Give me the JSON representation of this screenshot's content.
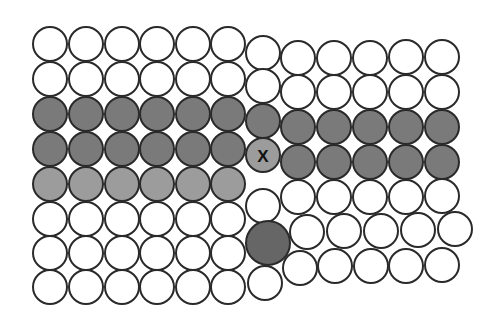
{
  "diagram": {
    "type": "crystal-lattice-defects",
    "colors": {
      "white": "#ffffff",
      "dark": "#7a7a7a",
      "light": "#9c9c9c",
      "impurity": "#666666",
      "stroke": "#2a2a2a"
    },
    "stroke_width": 2,
    "atoms": [
      {
        "x": 50,
        "y": 44,
        "r": 17,
        "fill": "white"
      },
      {
        "x": 86,
        "y": 44,
        "r": 17,
        "fill": "white"
      },
      {
        "x": 122,
        "y": 44,
        "r": 17,
        "fill": "white"
      },
      {
        "x": 157,
        "y": 44,
        "r": 17,
        "fill": "white"
      },
      {
        "x": 193,
        "y": 44,
        "r": 17,
        "fill": "white"
      },
      {
        "x": 228,
        "y": 44,
        "r": 17,
        "fill": "white"
      },
      {
        "x": 50,
        "y": 79,
        "r": 17,
        "fill": "white"
      },
      {
        "x": 86,
        "y": 79,
        "r": 17,
        "fill": "white"
      },
      {
        "x": 122,
        "y": 79,
        "r": 17,
        "fill": "white"
      },
      {
        "x": 157,
        "y": 79,
        "r": 17,
        "fill": "white"
      },
      {
        "x": 193,
        "y": 79,
        "r": 17,
        "fill": "white"
      },
      {
        "x": 228,
        "y": 79,
        "r": 17,
        "fill": "white"
      },
      {
        "x": 50,
        "y": 114,
        "r": 17,
        "fill": "dark"
      },
      {
        "x": 86,
        "y": 114,
        "r": 17,
        "fill": "dark"
      },
      {
        "x": 122,
        "y": 114,
        "r": 17,
        "fill": "dark"
      },
      {
        "x": 157,
        "y": 114,
        "r": 17,
        "fill": "dark"
      },
      {
        "x": 193,
        "y": 114,
        "r": 17,
        "fill": "dark"
      },
      {
        "x": 228,
        "y": 114,
        "r": 17,
        "fill": "dark"
      },
      {
        "x": 50,
        "y": 149,
        "r": 17,
        "fill": "dark"
      },
      {
        "x": 86,
        "y": 149,
        "r": 17,
        "fill": "dark"
      },
      {
        "x": 122,
        "y": 149,
        "r": 17,
        "fill": "dark"
      },
      {
        "x": 157,
        "y": 149,
        "r": 17,
        "fill": "dark"
      },
      {
        "x": 193,
        "y": 149,
        "r": 17,
        "fill": "dark"
      },
      {
        "x": 228,
        "y": 149,
        "r": 17,
        "fill": "dark"
      },
      {
        "x": 50,
        "y": 184,
        "r": 17,
        "fill": "light"
      },
      {
        "x": 86,
        "y": 184,
        "r": 17,
        "fill": "light"
      },
      {
        "x": 122,
        "y": 184,
        "r": 17,
        "fill": "light"
      },
      {
        "x": 157,
        "y": 184,
        "r": 17,
        "fill": "light"
      },
      {
        "x": 193,
        "y": 184,
        "r": 17,
        "fill": "light"
      },
      {
        "x": 228,
        "y": 184,
        "r": 17,
        "fill": "light"
      },
      {
        "x": 50,
        "y": 219,
        "r": 17,
        "fill": "white"
      },
      {
        "x": 86,
        "y": 219,
        "r": 17,
        "fill": "white"
      },
      {
        "x": 122,
        "y": 219,
        "r": 17,
        "fill": "white"
      },
      {
        "x": 157,
        "y": 219,
        "r": 17,
        "fill": "white"
      },
      {
        "x": 193,
        "y": 219,
        "r": 17,
        "fill": "white"
      },
      {
        "x": 228,
        "y": 219,
        "r": 17,
        "fill": "white"
      },
      {
        "x": 50,
        "y": 253,
        "r": 17,
        "fill": "white"
      },
      {
        "x": 86,
        "y": 253,
        "r": 17,
        "fill": "white"
      },
      {
        "x": 122,
        "y": 253,
        "r": 17,
        "fill": "white"
      },
      {
        "x": 157,
        "y": 253,
        "r": 17,
        "fill": "white"
      },
      {
        "x": 193,
        "y": 253,
        "r": 17,
        "fill": "white"
      },
      {
        "x": 228,
        "y": 253,
        "r": 17,
        "fill": "white"
      },
      {
        "x": 50,
        "y": 287,
        "r": 17,
        "fill": "white"
      },
      {
        "x": 86,
        "y": 287,
        "r": 17,
        "fill": "white"
      },
      {
        "x": 122,
        "y": 287,
        "r": 17,
        "fill": "white"
      },
      {
        "x": 157,
        "y": 287,
        "r": 17,
        "fill": "white"
      },
      {
        "x": 193,
        "y": 287,
        "r": 17,
        "fill": "white"
      },
      {
        "x": 228,
        "y": 287,
        "r": 17,
        "fill": "white"
      },
      {
        "x": 263,
        "y": 53,
        "r": 17,
        "fill": "white"
      },
      {
        "x": 263,
        "y": 86,
        "r": 17,
        "fill": "white"
      },
      {
        "x": 263,
        "y": 121,
        "r": 17,
        "fill": "dark"
      },
      {
        "x": 263,
        "y": 206,
        "r": 17,
        "fill": "white"
      },
      {
        "x": 268,
        "y": 243,
        "r": 22,
        "fill": "impurity"
      },
      {
        "x": 265,
        "y": 283,
        "r": 17,
        "fill": "white"
      },
      {
        "x": 298,
        "y": 58,
        "r": 17,
        "fill": "white"
      },
      {
        "x": 334,
        "y": 58,
        "r": 17,
        "fill": "white"
      },
      {
        "x": 370,
        "y": 58,
        "r": 17,
        "fill": "white"
      },
      {
        "x": 406,
        "y": 57,
        "r": 17,
        "fill": "white"
      },
      {
        "x": 442,
        "y": 57,
        "r": 17,
        "fill": "white"
      },
      {
        "x": 298,
        "y": 92,
        "r": 17,
        "fill": "white"
      },
      {
        "x": 334,
        "y": 92,
        "r": 17,
        "fill": "white"
      },
      {
        "x": 370,
        "y": 92,
        "r": 17,
        "fill": "white"
      },
      {
        "x": 406,
        "y": 92,
        "r": 17,
        "fill": "white"
      },
      {
        "x": 442,
        "y": 92,
        "r": 17,
        "fill": "white"
      },
      {
        "x": 298,
        "y": 127,
        "r": 17,
        "fill": "dark"
      },
      {
        "x": 334,
        "y": 127,
        "r": 17,
        "fill": "dark"
      },
      {
        "x": 370,
        "y": 127,
        "r": 17,
        "fill": "dark"
      },
      {
        "x": 406,
        "y": 127,
        "r": 17,
        "fill": "dark"
      },
      {
        "x": 442,
        "y": 127,
        "r": 17,
        "fill": "dark"
      },
      {
        "x": 298,
        "y": 162,
        "r": 17,
        "fill": "dark"
      },
      {
        "x": 334,
        "y": 162,
        "r": 17,
        "fill": "dark"
      },
      {
        "x": 370,
        "y": 162,
        "r": 17,
        "fill": "dark"
      },
      {
        "x": 406,
        "y": 162,
        "r": 17,
        "fill": "dark"
      },
      {
        "x": 442,
        "y": 162,
        "r": 17,
        "fill": "dark"
      },
      {
        "x": 298,
        "y": 197,
        "r": 17,
        "fill": "white"
      },
      {
        "x": 334,
        "y": 197,
        "r": 17,
        "fill": "white"
      },
      {
        "x": 370,
        "y": 197,
        "r": 17,
        "fill": "white"
      },
      {
        "x": 406,
        "y": 197,
        "r": 17,
        "fill": "white"
      },
      {
        "x": 442,
        "y": 196,
        "r": 17,
        "fill": "white"
      },
      {
        "x": 307,
        "y": 232,
        "r": 17,
        "fill": "white"
      },
      {
        "x": 344,
        "y": 231,
        "r": 17,
        "fill": "white"
      },
      {
        "x": 381,
        "y": 231,
        "r": 17,
        "fill": "white"
      },
      {
        "x": 418,
        "y": 230,
        "r": 17,
        "fill": "white"
      },
      {
        "x": 455,
        "y": 229,
        "r": 17,
        "fill": "white"
      },
      {
        "x": 300,
        "y": 268,
        "r": 17,
        "fill": "white"
      },
      {
        "x": 335,
        "y": 266,
        "r": 17,
        "fill": "white"
      },
      {
        "x": 371,
        "y": 266,
        "r": 17,
        "fill": "white"
      },
      {
        "x": 406,
        "y": 266,
        "r": 17,
        "fill": "white"
      },
      {
        "x": 442,
        "y": 265,
        "r": 17,
        "fill": "white"
      }
    ],
    "labeled_atom": {
      "x": 263,
      "y": 155,
      "r": 17,
      "fill": "light",
      "label": "X"
    }
  }
}
